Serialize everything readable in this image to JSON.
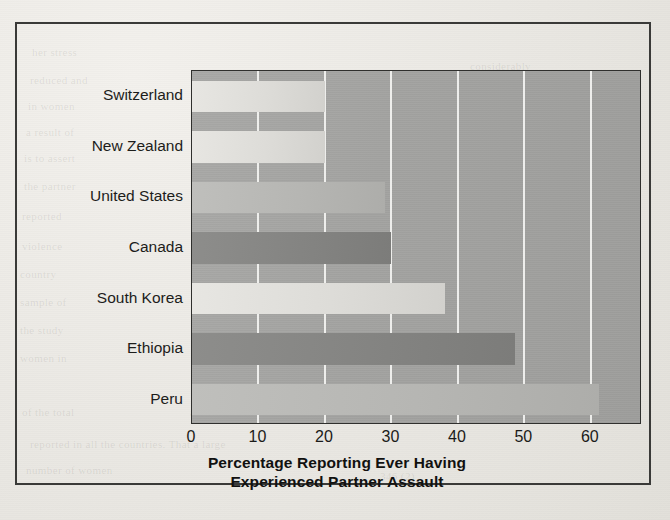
{
  "figure": {
    "x_axis_title_line1": "Percentage Reporting Ever Having",
    "x_axis_title_line2": "Experienced Partner Assault"
  },
  "ghost_text": [
    {
      "text": "her stress",
      "left": 32,
      "top": 46
    },
    {
      "text": "reduced and",
      "left": 30,
      "top": 74
    },
    {
      "text": "in women",
      "left": 28,
      "top": 100
    },
    {
      "text": "a result of",
      "left": 26,
      "top": 126
    },
    {
      "text": "is to assert",
      "left": 24,
      "top": 152
    },
    {
      "text": "the partner",
      "left": 24,
      "top": 180
    },
    {
      "text": "reported",
      "left": 22,
      "top": 210
    },
    {
      "text": "violence",
      "left": 22,
      "top": 240
    },
    {
      "text": "country",
      "left": 20,
      "top": 268
    },
    {
      "text": "sample of",
      "left": 20,
      "top": 296
    },
    {
      "text": "the study",
      "left": 20,
      "top": 324
    },
    {
      "text": "women in",
      "left": 20,
      "top": 352
    },
    {
      "text": "of the total",
      "left": 22,
      "top": 406
    },
    {
      "text": "and partner assault was",
      "left": 190,
      "top": 406
    },
    {
      "text": "reported in all the countries. That a large",
      "left": 30,
      "top": 438
    },
    {
      "text": "number of women",
      "left": 26,
      "top": 464
    },
    {
      "text": "considerably",
      "left": 470,
      "top": 60
    },
    {
      "text": "reported",
      "left": 476,
      "top": 92
    },
    {
      "text": "women were",
      "left": 472,
      "top": 120
    },
    {
      "text": "far more",
      "left": 484,
      "top": 152
    },
    {
      "text": "than men",
      "left": 482,
      "top": 184
    },
    {
      "text": "in their",
      "left": 488,
      "top": 216
    },
    {
      "text": "relations",
      "left": 486,
      "top": 250
    },
    {
      "text": "and they",
      "left": 488,
      "top": 282
    },
    {
      "text": "were also",
      "left": 486,
      "top": 316
    },
    {
      "text": "346 (2)",
      "left": 380,
      "top": 470
    }
  ],
  "chart_data": {
    "type": "bar",
    "orientation": "horizontal",
    "title": "",
    "xlabel": "Percentage Reporting Ever Having Experienced Partner Assault",
    "ylabel": "",
    "categories": [
      "Switzerland",
      "New Zealand",
      "United States",
      "Canada",
      "South Korea",
      "Ethiopia",
      "Peru"
    ],
    "values": [
      20,
      20,
      29,
      30,
      38,
      48.6,
      61.2
    ],
    "xlim": [
      0,
      67.7
    ],
    "ylim": null,
    "xticks": [
      0,
      10,
      20,
      30,
      40,
      50,
      60
    ],
    "xtick_labels": [
      "0",
      "10",
      "20",
      "30",
      "40",
      "50",
      "60"
    ],
    "grid": "vertical-white-gridlines",
    "legend": "none",
    "bar_shades": [
      "light",
      "light",
      "mid",
      "dark",
      "light",
      "dark",
      "mid"
    ],
    "plot_background": "#a3a3a1",
    "gridline_color": "#f8f8f6",
    "axis_color": "#2f2f2d"
  }
}
